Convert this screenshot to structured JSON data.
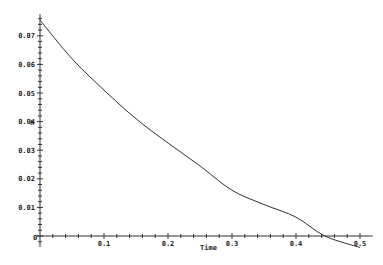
{
  "chart_data": {
    "type": "line",
    "title": "",
    "xlabel": "Time",
    "ylabel": "h",
    "xlim": [
      0,
      0.5
    ],
    "ylim": [
      -0.005,
      0.077
    ],
    "grid": false,
    "legend": null,
    "x_ticks": [
      "0.1",
      "0.2",
      "0.3",
      "0.4",
      "0.5"
    ],
    "y_ticks": [
      "0.01",
      "0.02",
      "0.03",
      "0.04",
      "0.05",
      "0.06",
      "0.07"
    ],
    "origin_label": "0",
    "series": [
      {
        "name": "h",
        "color": "#333333",
        "x": [
          0,
          0.05,
          0.1,
          0.15,
          0.2,
          0.25,
          0.3,
          0.35,
          0.4,
          0.445,
          0.5
        ],
        "y": [
          0.0755,
          0.062,
          0.051,
          0.041,
          0.0325,
          0.0245,
          0.016,
          0.011,
          0.0066,
          0.0,
          -0.004
        ]
      }
    ]
  }
}
